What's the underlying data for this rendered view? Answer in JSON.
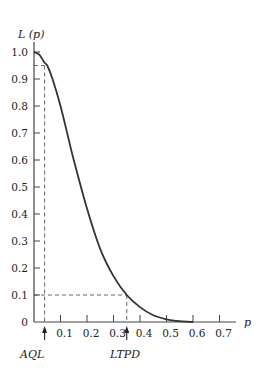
{
  "chart_data": {
    "type": "line",
    "title": "",
    "xlabel": "p",
    "ylabel": "L (p)",
    "xlim": [
      0,
      0.75
    ],
    "ylim": [
      0,
      1.05
    ],
    "x_ticks": [
      "0.1",
      "0.2",
      "0.3",
      "0.4",
      "0.5",
      "0.6",
      "0.7"
    ],
    "y_ticks": [
      "0",
      "0.1",
      "0.2",
      "0.3",
      "0.4",
      "0.5",
      "0.6",
      "0.7",
      "0.8",
      "0.9",
      "1.0"
    ],
    "grid": false,
    "series": [
      {
        "name": "OC curve L(p)",
        "x": [
          0,
          0.02,
          0.04,
          0.05,
          0.07,
          0.1,
          0.13,
          0.15,
          0.2,
          0.25,
          0.3,
          0.35,
          0.4,
          0.45,
          0.5,
          0.55,
          0.6
        ],
        "y": [
          1.0,
          0.99,
          0.96,
          0.95,
          0.9,
          0.8,
          0.68,
          0.6,
          0.42,
          0.27,
          0.17,
          0.1,
          0.055,
          0.025,
          0.01,
          0.003,
          0.0
        ]
      }
    ],
    "annotations": [
      {
        "label": "AQL",
        "x": 0.04,
        "y": 0.95,
        "style": "dashed guide lines + arrow"
      },
      {
        "label": "LTPD",
        "x": 0.35,
        "y": 0.1,
        "style": "dashed guide lines + arrow"
      }
    ]
  },
  "labels": {
    "y_axis": "L (p)",
    "x_axis": "p",
    "aql": "AQL",
    "ltpd": "LTPD",
    "zero": "0"
  }
}
